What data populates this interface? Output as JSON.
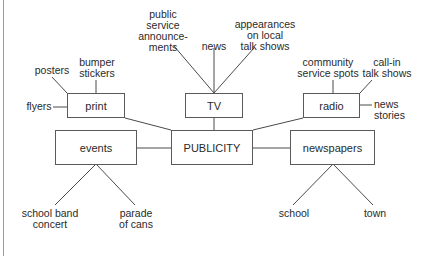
{
  "diagram": {
    "center": "PUBLICITY",
    "nodes": {
      "print": "print",
      "tv": "TV",
      "radio": "radio",
      "events": "events",
      "publicity": "PUBLICITY",
      "newspapers": "newspapers"
    },
    "leaves": {
      "posters": "posters",
      "bumper_stickers": "bumper\nstickers",
      "flyers": "flyers",
      "psa": "public\nservice\nannounce-\nments",
      "news": "news",
      "appearances": "appearances\non local\ntalk shows",
      "community_spots": "community\nservice spots",
      "call_in": "call-in\ntalk shows",
      "news_stories": "news\nstories",
      "school_band": "school band\nconcert",
      "parade": "parade\nof cans",
      "school": "school",
      "town": "town"
    },
    "edges": [
      [
        "PUBLICITY",
        "print"
      ],
      [
        "PUBLICITY",
        "TV"
      ],
      [
        "PUBLICITY",
        "radio"
      ],
      [
        "PUBLICITY",
        "events"
      ],
      [
        "PUBLICITY",
        "newspapers"
      ],
      [
        "print",
        "posters"
      ],
      [
        "print",
        "bumper stickers"
      ],
      [
        "print",
        "flyers"
      ],
      [
        "TV",
        "public service announcements"
      ],
      [
        "TV",
        "news"
      ],
      [
        "TV",
        "appearances on local talk shows"
      ],
      [
        "radio",
        "community service spots"
      ],
      [
        "radio",
        "call-in talk shows"
      ],
      [
        "radio",
        "news stories"
      ],
      [
        "events",
        "school band concert"
      ],
      [
        "events",
        "parade of cans"
      ],
      [
        "newspapers",
        "school"
      ],
      [
        "newspapers",
        "town"
      ]
    ]
  }
}
